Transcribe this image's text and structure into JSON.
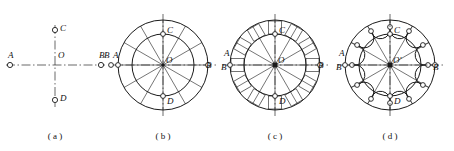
{
  "figure": {
    "width": 454,
    "height": 151,
    "background": "#ffffff",
    "line_color": "#1a1a1a",
    "centerline_color": "#2a2a2a",
    "node_fill": "#ffffff"
  },
  "captions": [
    {
      "id": "a",
      "text": "( a )",
      "x": 55,
      "y": 131
    },
    {
      "id": "b",
      "text": "( b )",
      "x": 163,
      "y": 131
    },
    {
      "id": "c",
      "text": "( c )",
      "x": 275,
      "y": 131
    },
    {
      "id": "d",
      "text": "( d )",
      "x": 390,
      "y": 131
    }
  ],
  "panels": [
    {
      "id": "a",
      "name": "centerlines-only",
      "center": {
        "x": 55,
        "y": 65,
        "label": "O"
      },
      "points": [
        {
          "label": "A",
          "x": 10,
          "y": 65
        },
        {
          "label": "B",
          "x": 101,
          "y": 65
        },
        {
          "label": "C",
          "x": 55,
          "y": 30
        },
        {
          "label": "D",
          "x": 55,
          "y": 100
        }
      ],
      "description": "Horizontal and vertical centre lines with end points A, B, C, D about centre O."
    },
    {
      "id": "b",
      "name": "concentric-circles-with-spokes",
      "center": {
        "x": 163,
        "y": 65,
        "label": "O"
      },
      "outer_radius": 45,
      "inner_radius": 31,
      "spokes": 12,
      "points": [
        {
          "label": "A",
          "x": 118,
          "y": 65
        },
        {
          "label": "B",
          "x": 111,
          "y": 65
        },
        {
          "label": "B",
          "x": 208,
          "y": 65
        },
        {
          "label": "C",
          "x": 163,
          "y": 34
        },
        {
          "label": "D",
          "x": 163,
          "y": 96
        }
      ],
      "description": "Outer and inner circles drawn, divided into twelve equal radial sectors."
    },
    {
      "id": "c",
      "name": "radial-slots-added",
      "center": {
        "x": 275,
        "y": 65,
        "label": "O"
      },
      "outer_radius": 45,
      "inner_radius": 31,
      "spokes": 12,
      "slots": 12,
      "points": [
        {
          "label": "A",
          "x": 230,
          "y": 62
        },
        {
          "label": "B",
          "x": 224,
          "y": 70
        },
        {
          "label": "B",
          "x": 320,
          "y": 65
        },
        {
          "label": "C",
          "x": 275,
          "y": 34
        },
        {
          "label": "D",
          "x": 275,
          "y": 96
        }
      ],
      "description": "Twelve rectangular slots laid out in the annulus between the two circles."
    },
    {
      "id": "d",
      "name": "nodes-and-chords",
      "center": {
        "x": 390,
        "y": 65,
        "label": "O'"
      },
      "outer_radius": 45,
      "inner_radius": 31,
      "node_radius": 38,
      "spokes": 12,
      "nodes": 12,
      "points": [
        {
          "label": "A",
          "x": 345,
          "y": 60
        },
        {
          "label": "B",
          "x": 339,
          "y": 71
        },
        {
          "label": "B",
          "x": 436,
          "y": 70
        },
        {
          "label": "C",
          "x": 390,
          "y": 34
        },
        {
          "label": "D",
          "x": 390,
          "y": 96
        }
      ],
      "description": "Twelve small nodes placed on the pitch circle and joined by chord arcs to complete the outline."
    }
  ]
}
